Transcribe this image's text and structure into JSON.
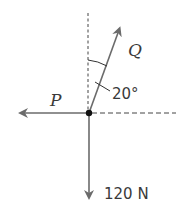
{
  "diagram": {
    "type": "force-diagram",
    "forces": [
      {
        "label": "P",
        "direction": "left (horizontal)"
      },
      {
        "label": "Q",
        "direction": "20° from vertical, up-right"
      },
      {
        "label": "120 N",
        "direction": "down (vertical)"
      }
    ],
    "angle_label": "20°",
    "labels": {
      "P": "P",
      "Q": "Q",
      "weight": "120 N",
      "angle": "20°"
    },
    "colors": {
      "arrow": "#6b6b6b",
      "dashed": "#444444",
      "point": "#111111",
      "text": "#3a3a3a"
    }
  }
}
